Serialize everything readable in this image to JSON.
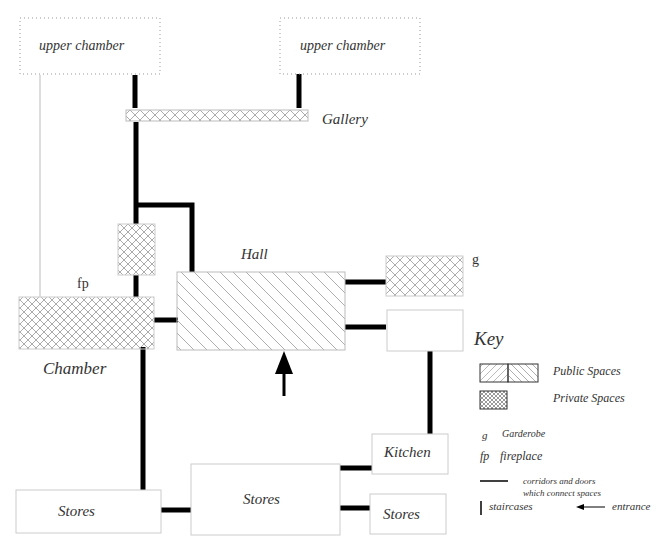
{
  "rooms": {
    "upper_chamber_left": "upper chamber",
    "upper_chamber_right": "upper chamber",
    "gallery": "Gallery",
    "hall": "Hall",
    "chamber": "Chamber",
    "fp_marker": "fp",
    "g_marker": "g",
    "kitchen": "Kitchen",
    "stores_left": "Stores",
    "stores_center": "Stores",
    "stores_right": "Stores"
  },
  "key": {
    "title": "Key",
    "public_spaces": "Public Spaces",
    "private_spaces": "Private Spaces",
    "g_abbr": "g",
    "g_label": "Garderobe",
    "fp_abbr": "fp",
    "fp_label": "fireplace",
    "corridors_line1": "corridors and doors",
    "corridors_line2": "which connect spaces",
    "staircases": "staircases",
    "entrance": "entrance"
  },
  "colors": {
    "line": "#000000",
    "border": "#c8c8c8",
    "hatch": "#888888"
  }
}
